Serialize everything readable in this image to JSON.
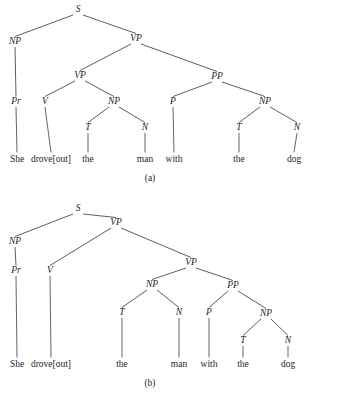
{
  "figure": {
    "sentence_words": [
      "She",
      "drove[out]",
      "the",
      "man",
      "with",
      "the",
      "dog"
    ],
    "line_color": "#4a4a52",
    "text_color": "#232328",
    "background_color": "#ffffff"
  },
  "trees": [
    {
      "id": "tree-a",
      "caption": "(a)",
      "caption_x": 150,
      "caption_y": 181,
      "reading": "PP attaches high to VP (instrumental reading)",
      "nodes": [
        {
          "id": "a-s",
          "label": "S",
          "x": 78,
          "y": 12,
          "kind": "phrasal"
        },
        {
          "id": "a-np1",
          "label": "NP",
          "x": 15,
          "y": 44,
          "kind": "phrasal"
        },
        {
          "id": "a-vp1",
          "label": "VP",
          "x": 136,
          "y": 41,
          "kind": "phrasal"
        },
        {
          "id": "a-pr",
          "label": "Pr",
          "x": 16,
          "y": 104,
          "kind": "pos"
        },
        {
          "id": "a-vp2",
          "label": "VP",
          "x": 80,
          "y": 78,
          "kind": "phrasal"
        },
        {
          "id": "a-pp",
          "label": "PP",
          "x": 217,
          "y": 79,
          "kind": "phrasal"
        },
        {
          "id": "a-v",
          "label": "V",
          "x": 45,
          "y": 104,
          "kind": "pos"
        },
        {
          "id": "a-np2",
          "label": "NP",
          "x": 114,
          "y": 104,
          "kind": "phrasal"
        },
        {
          "id": "a-p",
          "label": "P",
          "x": 173,
          "y": 104,
          "kind": "pos"
        },
        {
          "id": "a-np3",
          "label": "NP",
          "x": 265,
          "y": 104,
          "kind": "phrasal"
        },
        {
          "id": "a-t1",
          "label": "T",
          "x": 88,
          "y": 130,
          "kind": "pos"
        },
        {
          "id": "a-n1",
          "label": "N",
          "x": 145,
          "y": 130,
          "kind": "pos"
        },
        {
          "id": "a-t2",
          "label": "T",
          "x": 239,
          "y": 130,
          "kind": "pos"
        },
        {
          "id": "a-n2",
          "label": "N",
          "x": 297,
          "y": 130,
          "kind": "pos"
        }
      ],
      "edges": [
        {
          "from": "a-s",
          "to": "a-np1"
        },
        {
          "from": "a-s",
          "to": "a-vp1"
        },
        {
          "from": "a-np1",
          "to": "a-pr"
        },
        {
          "from": "a-vp1",
          "to": "a-vp2"
        },
        {
          "from": "a-vp1",
          "to": "a-pp"
        },
        {
          "from": "a-vp2",
          "to": "a-v"
        },
        {
          "from": "a-vp2",
          "to": "a-np2"
        },
        {
          "from": "a-pp",
          "to": "a-p"
        },
        {
          "from": "a-pp",
          "to": "a-np3"
        },
        {
          "from": "a-np2",
          "to": "a-t1"
        },
        {
          "from": "a-np2",
          "to": "a-n1"
        },
        {
          "from": "a-np3",
          "to": "a-t2"
        },
        {
          "from": "a-np3",
          "to": "a-n2"
        }
      ],
      "leaves": [
        {
          "id": "a-w1",
          "parent": "a-pr",
          "word": "She",
          "x": 17,
          "y": 162
        },
        {
          "id": "a-w2",
          "parent": "a-v",
          "word": "drove[out]",
          "x": 51,
          "y": 162
        },
        {
          "id": "a-w3",
          "parent": "a-t1",
          "word": "the",
          "x": 88,
          "y": 162
        },
        {
          "id": "a-w4",
          "parent": "a-n1",
          "word": "man",
          "x": 145,
          "y": 162
        },
        {
          "id": "a-w5",
          "parent": "a-p",
          "word": "with",
          "x": 174,
          "y": 162
        },
        {
          "id": "a-w6",
          "parent": "a-t2",
          "word": "the",
          "x": 239,
          "y": 162
        },
        {
          "id": "a-w7",
          "parent": "a-n2",
          "word": "dog",
          "x": 294,
          "y": 162
        }
      ]
    },
    {
      "id": "tree-b",
      "caption": "(b)",
      "caption_x": 150,
      "caption_y": 191,
      "reading": "PP attaches low inside the lower VP",
      "nodes": [
        {
          "id": "b-s",
          "label": "S",
          "x": 78,
          "y": 16,
          "kind": "phrasal"
        },
        {
          "id": "b-np1",
          "label": "NP",
          "x": 15,
          "y": 49,
          "kind": "phrasal"
        },
        {
          "id": "b-vp1",
          "label": "VP",
          "x": 116,
          "y": 30,
          "kind": "phrasal"
        },
        {
          "id": "b-pr",
          "label": "Pr",
          "x": 16,
          "y": 78,
          "kind": "pos"
        },
        {
          "id": "b-v",
          "label": "V",
          "x": 50,
          "y": 78,
          "kind": "pos"
        },
        {
          "id": "b-vp2",
          "label": "VP",
          "x": 191,
          "y": 70,
          "kind": "phrasal"
        },
        {
          "id": "b-np2",
          "label": "NP",
          "x": 152,
          "y": 92,
          "kind": "phrasal"
        },
        {
          "id": "b-pp",
          "label": "PP",
          "x": 233,
          "y": 93,
          "kind": "phrasal"
        },
        {
          "id": "b-t1",
          "label": "T",
          "x": 122,
          "y": 120,
          "kind": "pos"
        },
        {
          "id": "b-n1",
          "label": "N",
          "x": 179,
          "y": 120,
          "kind": "pos"
        },
        {
          "id": "b-p",
          "label": "P",
          "x": 209,
          "y": 120,
          "kind": "pos"
        },
        {
          "id": "b-np3",
          "label": "NP",
          "x": 266,
          "y": 121,
          "kind": "phrasal"
        },
        {
          "id": "b-t2",
          "label": "T",
          "x": 243,
          "y": 148,
          "kind": "pos"
        },
        {
          "id": "b-n2",
          "label": "N",
          "x": 288,
          "y": 148,
          "kind": "pos"
        }
      ],
      "edges": [
        {
          "from": "b-s",
          "to": "b-np1"
        },
        {
          "from": "b-s",
          "to": "b-vp1"
        },
        {
          "from": "b-np1",
          "to": "b-pr"
        },
        {
          "from": "b-vp1",
          "to": "b-v"
        },
        {
          "from": "b-vp1",
          "to": "b-vp2"
        },
        {
          "from": "b-vp2",
          "to": "b-np2"
        },
        {
          "from": "b-vp2",
          "to": "b-pp"
        },
        {
          "from": "b-np2",
          "to": "b-t1"
        },
        {
          "from": "b-np2",
          "to": "b-n1"
        },
        {
          "from": "b-pp",
          "to": "b-p"
        },
        {
          "from": "b-pp",
          "to": "b-np3"
        },
        {
          "from": "b-np3",
          "to": "b-t2"
        },
        {
          "from": "b-np3",
          "to": "b-n2"
        }
      ],
      "leaves": [
        {
          "id": "b-w1",
          "parent": "b-pr",
          "word": "She",
          "x": 17,
          "y": 172
        },
        {
          "id": "b-w2",
          "parent": "b-v",
          "word": "drove[out]",
          "x": 51,
          "y": 172
        },
        {
          "id": "b-w3",
          "parent": "b-t1",
          "word": "the",
          "x": 122,
          "y": 172
        },
        {
          "id": "b-w4",
          "parent": "b-n1",
          "word": "man",
          "x": 179,
          "y": 172
        },
        {
          "id": "b-w5",
          "parent": "b-p",
          "word": "with",
          "x": 209,
          "y": 172
        },
        {
          "id": "b-w6",
          "parent": "b-t2",
          "word": "the",
          "x": 243,
          "y": 172
        },
        {
          "id": "b-w7",
          "parent": "b-n2",
          "word": "dog",
          "x": 288,
          "y": 172
        }
      ]
    }
  ]
}
